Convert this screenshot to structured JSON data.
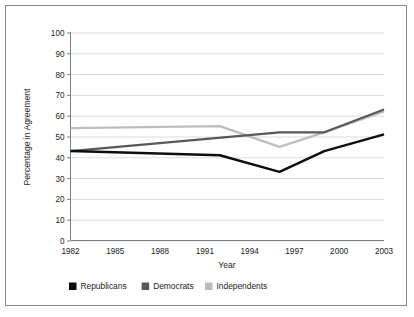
{
  "chart_data": {
    "type": "line",
    "title": "",
    "xlabel": "Year",
    "ylabel": "Percentage in Agreement",
    "xlim": [
      1982,
      2003
    ],
    "ylim": [
      0,
      100
    ],
    "grid": true,
    "legend_position": "bottom",
    "x_tick_labels": [
      "1982",
      "1985",
      "1988",
      "1991",
      "1994",
      "1997",
      "2000",
      "2003"
    ],
    "x_ticks": [
      1982,
      1985,
      1988,
      1991,
      1994,
      1997,
      2000,
      2003
    ],
    "y_tick_labels": [
      "0",
      "10",
      "20",
      "30",
      "40",
      "50",
      "60",
      "70",
      "80",
      "90",
      "100"
    ],
    "y_ticks": [
      0,
      10,
      20,
      30,
      40,
      50,
      60,
      70,
      80,
      90,
      100
    ],
    "series": [
      {
        "name": "Republicans",
        "color": "#0d0d0d",
        "x": [
          1982,
          1992,
          1996,
          1999,
          2003
        ],
        "values": [
          43,
          41,
          33,
          43,
          51
        ]
      },
      {
        "name": "Democrats",
        "color": "#585858",
        "x": [
          1982,
          1996,
          1999,
          2003
        ],
        "values": [
          43,
          52,
          52,
          63
        ]
      },
      {
        "name": "Independents",
        "color": "#bdbdbd",
        "x": [
          1982,
          1992,
          1996,
          1999,
          2003
        ],
        "values": [
          54,
          55,
          45,
          52,
          62
        ]
      }
    ]
  },
  "legend": {
    "items": [
      {
        "label": "Republicans",
        "color": "#0d0d0d"
      },
      {
        "label": "Democrats",
        "color": "#585858"
      },
      {
        "label": "Independents",
        "color": "#bdbdbd"
      }
    ]
  },
  "axes": {
    "x_title": "Year",
    "y_title": "Percentage in Agreement"
  }
}
